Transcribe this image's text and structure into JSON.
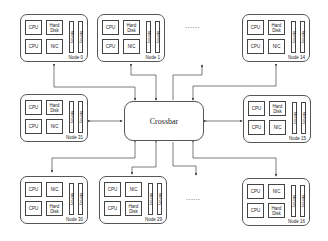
{
  "crossbar": {
    "label": "Crossbar"
  },
  "ellipsis": {
    "top": "......",
    "bottom": "......"
  },
  "components": {
    "cpu": "CPU",
    "hard_disk_1": "Hard",
    "hard_disk_2": "Disk",
    "nic": "NIC",
    "memory": "Memory"
  },
  "nodes": [
    {
      "id": "node-0",
      "label": "Node 0",
      "layout": "disk-top"
    },
    {
      "id": "node-1",
      "label": "Node 1",
      "layout": "disk-top"
    },
    {
      "id": "node-14",
      "label": "Node 14",
      "layout": "disk-top"
    },
    {
      "id": "node-31",
      "label": "Node 31",
      "layout": "disk-top"
    },
    {
      "id": "node-15",
      "label": "Node 15",
      "layout": "disk-top"
    },
    {
      "id": "node-30",
      "label": "Node 30",
      "layout": "nic-top"
    },
    {
      "id": "node-29",
      "label": "Node 29",
      "layout": "nic-top"
    },
    {
      "id": "node-16",
      "label": "Node 16",
      "layout": "nic-top"
    }
  ],
  "colors": {
    "line": "#444444",
    "box_border": "#555555",
    "background": "#ffffff"
  }
}
